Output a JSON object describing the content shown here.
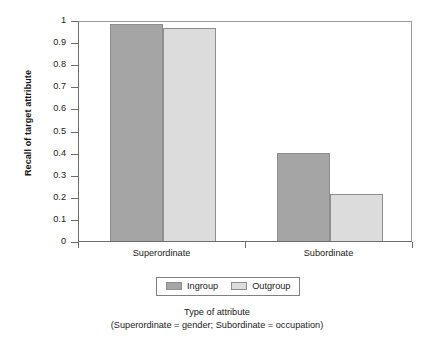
{
  "chart_data": {
    "type": "bar",
    "title": "",
    "categories": [
      "Superordinate",
      "Subordinate"
    ],
    "series": [
      {
        "name": "Ingroup",
        "values": [
          0.98,
          0.4
        ],
        "color": "#a5a5a5"
      },
      {
        "name": "Outgroup",
        "values": [
          0.965,
          0.215
        ],
        "color": "#dcdcdc"
      }
    ],
    "xlabel": "Type of attribute",
    "xlabel_note": "(Superordinate = gender; Subordinate = occupation)",
    "ylabel": "Recall of target attribute",
    "ylim": [
      0,
      1
    ],
    "ytick_values": [
      0,
      0.1,
      0.2,
      0.3,
      0.4,
      0.5,
      0.6,
      0.7,
      0.8,
      0.9,
      1
    ],
    "ytick_labels": [
      "0",
      "0.1",
      "0.2",
      "0.3",
      "0.4",
      "0.5",
      "0.6",
      "0.7",
      "0.8",
      "0.9",
      "1"
    ],
    "grid": false,
    "legend_position": "bottom-center"
  },
  "axes": {
    "y_title": "Recall of target attribute",
    "y_ticks": [
      {
        "label": "1",
        "value": 1.0
      },
      {
        "label": "0.9",
        "value": 0.9
      },
      {
        "label": "0.8",
        "value": 0.8
      },
      {
        "label": "0.7",
        "value": 0.7
      },
      {
        "label": "0.6",
        "value": 0.6
      },
      {
        "label": "0.5",
        "value": 0.5
      },
      {
        "label": "0.4",
        "value": 0.4
      },
      {
        "label": "0.3",
        "value": 0.3
      },
      {
        "label": "0.2",
        "value": 0.2
      },
      {
        "label": "0.1",
        "value": 0.1
      },
      {
        "label": "0",
        "value": 0.0
      }
    ],
    "x_categories": [
      {
        "label": "Superordinate"
      },
      {
        "label": "Subordinate"
      }
    ],
    "x_title": "Type of attribute",
    "x_subtitle": "(Superordinate = gender; Subordinate = occupation)"
  },
  "legend": {
    "entries": [
      {
        "label": "Ingroup",
        "color": "#a5a5a5"
      },
      {
        "label": "Outgroup",
        "color": "#dcdcdc"
      }
    ]
  },
  "colors": {
    "ingroup": "#a5a5a5",
    "outgroup": "#dcdcdc",
    "bar_border": "#8e8e8e",
    "axis": "#6d6d6d",
    "frame_light": "#9a9a9a",
    "text": "#1a1a1a",
    "background": "#ffffff"
  }
}
